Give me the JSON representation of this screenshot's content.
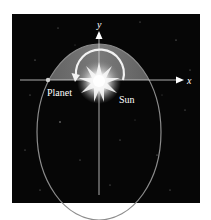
{
  "diagram": {
    "type": "orbit-diagram",
    "labels": {
      "y_axis": "y",
      "x_axis": "x",
      "planet": "Planet",
      "sun": "Sun"
    },
    "colors": {
      "page_background": "#ffffff",
      "space_background": "#060606",
      "shaded_region": "#6b6b6b",
      "ellipse_stroke": "#8c8c8c",
      "axis": "#d8d8d8",
      "text": "#ffffff"
    },
    "elements": {
      "panel": {
        "x": 12,
        "y": 14,
        "width": 188,
        "height": 189
      },
      "ellipse": {
        "cx": 99,
        "cy": 132,
        "rx": 62,
        "ry": 88
      },
      "x_axis": {
        "y": 80,
        "x1": 20,
        "x2": 183
      },
      "y_axis": {
        "x": 99,
        "y1": 195,
        "y2": 32
      },
      "sun": {
        "cx": 99,
        "cy": 80
      },
      "planet": {
        "cx": 48,
        "cy": 80
      },
      "rotation_arrow": {
        "cx": 99,
        "cy": 80,
        "r": 24,
        "direction": "counterclockwise"
      }
    }
  }
}
